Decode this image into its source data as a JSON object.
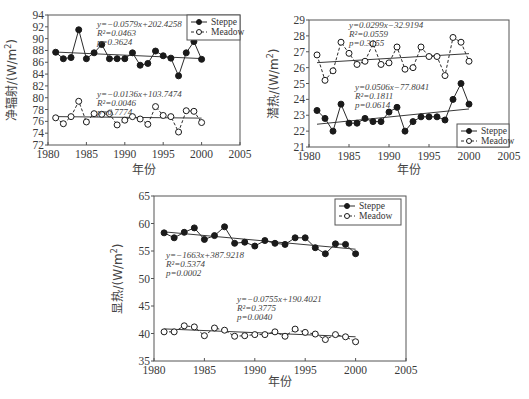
{
  "chart_data": [
    {
      "id": "net-radiation",
      "type": "line",
      "title": "",
      "xlabel": "年份",
      "ylabel": "净辐射/(W/m²)",
      "ylabel_main": "净辐射/(W/m",
      "ylabel_sup": "2",
      "ylabel_end": ")",
      "xlim": [
        1980,
        2005
      ],
      "ylim": [
        72,
        94
      ],
      "xticks": [
        1980,
        1985,
        1990,
        1995,
        2000,
        2005
      ],
      "yticks": [
        72,
        74,
        76,
        78,
        80,
        82,
        84,
        86,
        88,
        90,
        92,
        94
      ],
      "grid": false,
      "legend_position": "upper right",
      "x": [
        1981,
        1982,
        1983,
        1984,
        1985,
        1986,
        1987,
        1988,
        1989,
        1990,
        1991,
        1992,
        1993,
        1994,
        1995,
        1996,
        1997,
        1998,
        1999,
        2000
      ],
      "series": [
        {
          "name": "Steppe",
          "marker": "filled-circle",
          "line": "solid",
          "values": [
            87.7,
            86.6,
            86.8,
            91.5,
            86.6,
            87.6,
            89.0,
            86.6,
            86.6,
            86.6,
            87.6,
            85.5,
            85.8,
            87.9,
            87.1,
            86.7,
            83.7,
            87.6,
            89.5,
            86.5
          ],
          "trend": {
            "slope": -0.0579,
            "intercept": 202.4258,
            "equation": "y=−0.0579x+202.4258",
            "r2": "R²=0.0463",
            "p": "p=0.3624"
          }
        },
        {
          "name": "Meadow",
          "marker": "open-circle",
          "line": "dashed",
          "values": [
            76.6,
            75.6,
            76.8,
            79.4,
            75.9,
            77.3,
            77.2,
            77.3,
            75.4,
            76.2,
            76.8,
            76.4,
            75.5,
            78.5,
            77.0,
            76.8,
            74.2,
            77.8,
            77.7,
            75.8
          ],
          "trend": {
            "slope": -0.0136,
            "intercept": 103.7474,
            "equation": "y=−0.0136x+103.7474",
            "r2": "R²=0.0046",
            "p": "p=0.7774"
          }
        }
      ]
    },
    {
      "id": "latent-heat",
      "type": "line",
      "title": "",
      "xlabel": "年份",
      "ylabel": "潜热/(W/m²)",
      "ylabel_main": "潜热/(W/m",
      "ylabel_sup": "2",
      "ylabel_end": ")",
      "xlim": [
        1980,
        2005
      ],
      "ylim": [
        21,
        29
      ],
      "xticks": [
        1980,
        1985,
        1990,
        1995,
        2000,
        2005
      ],
      "yticks": [
        21,
        22,
        23,
        24,
        25,
        26,
        27,
        28,
        29
      ],
      "grid": false,
      "legend_position": "lower right",
      "x": [
        1981,
        1982,
        1983,
        1984,
        1985,
        1986,
        1987,
        1988,
        1989,
        1990,
        1991,
        1992,
        1993,
        1994,
        1995,
        1996,
        1997,
        1998,
        1999,
        2000
      ],
      "series": [
        {
          "name": "Steppe",
          "marker": "filled-circle",
          "line": "solid",
          "values": [
            23.3,
            22.8,
            22.0,
            23.7,
            22.5,
            22.5,
            22.8,
            22.6,
            22.6,
            23.2,
            23.5,
            22.0,
            22.6,
            22.9,
            22.9,
            22.9,
            22.7,
            24.0,
            25.0,
            23.7
          ],
          "trend": {
            "slope": 0.0506,
            "intercept": -77.8041,
            "equation": "y=0.0506x−77.8041",
            "r2": "R²=0.1811",
            "p": "p=0.0614"
          }
        },
        {
          "name": "Meadow",
          "marker": "open-circle",
          "line": "dashed",
          "values": [
            26.8,
            25.2,
            25.8,
            27.6,
            26.9,
            26.2,
            26.4,
            27.5,
            26.2,
            26.3,
            27.3,
            25.9,
            26.0,
            27.3,
            26.7,
            26.7,
            25.5,
            27.9,
            27.6,
            26.4
          ],
          "trend": {
            "slope": 0.0299,
            "intercept": -32.9194,
            "equation": "y=0.0299x−32.9194",
            "r2": "R²=0.0559",
            "p": "p=0.3155"
          }
        }
      ]
    },
    {
      "id": "sensible-heat",
      "type": "line",
      "title": "",
      "xlabel": "年份",
      "ylabel": "显热/(W/m²)",
      "ylabel_main": "显热/(W/m",
      "ylabel_sup": "2",
      "ylabel_end": ")",
      "xlim": [
        1980,
        2005
      ],
      "ylim": [
        35,
        65
      ],
      "xticks": [
        1980,
        1985,
        1990,
        1995,
        2000,
        2005
      ],
      "yticks": [
        35,
        40,
        45,
        50,
        55,
        60,
        65
      ],
      "grid": false,
      "legend_position": "upper right",
      "x": [
        1981,
        1982,
        1983,
        1984,
        1985,
        1986,
        1987,
        1988,
        1989,
        1990,
        1991,
        1992,
        1993,
        1994,
        1995,
        1996,
        1997,
        1998,
        1999,
        2000
      ],
      "series": [
        {
          "name": "Steppe",
          "marker": "filled-circle",
          "line": "solid",
          "values": [
            58.3,
            57.4,
            58.4,
            59.2,
            57.1,
            57.8,
            59.4,
            56.4,
            56.6,
            55.9,
            56.9,
            56.4,
            56.2,
            57.4,
            57.4,
            55.6,
            54.5,
            56.3,
            56.2,
            54.5
          ],
          "trend": {
            "slope": -0.1663,
            "intercept": 387.9218,
            "equation": "y=−1663x+387.9218",
            "r2": "R²=0.5374",
            "p": "p=0.0002"
          }
        },
        {
          "name": "Meadow",
          "marker": "open-circle",
          "line": "dashed",
          "values": [
            40.3,
            40.3,
            41.4,
            41.2,
            39.6,
            41.0,
            40.6,
            39.5,
            39.6,
            39.8,
            39.8,
            40.3,
            39.5,
            40.8,
            40.2,
            39.9,
            38.9,
            39.8,
            39.4,
            38.5
          ],
          "trend": {
            "slope": -0.0755,
            "intercept": 190.4021,
            "equation": "y=−0.0755x+190.4021",
            "r2": "R²=0.3775",
            "p": "p=0.0040"
          }
        }
      ]
    }
  ],
  "colors": {
    "line": "#2b2b2b",
    "frame": "#555555",
    "trend": "#3a3a3a",
    "text": "#444444",
    "background": "#ffffff"
  }
}
